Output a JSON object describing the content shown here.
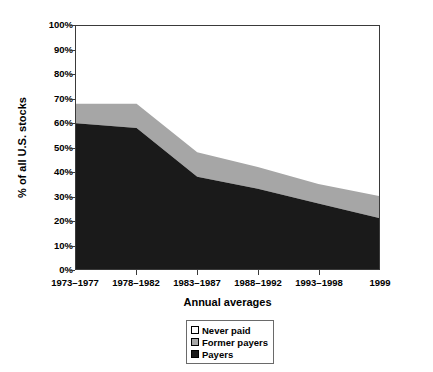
{
  "chart_data": {
    "type": "area",
    "stacked": true,
    "stack_total": 100,
    "title": "",
    "xlabel": "Annual averages",
    "ylabel": "% of all U.S. stocks",
    "categories": [
      "1973–1977",
      "1978–1982",
      "1983–1987",
      "1988–1992",
      "1993–1998",
      "1999"
    ],
    "ylim": [
      0,
      100
    ],
    "ytick_labels": [
      "0%",
      "10%",
      "20%",
      "30%",
      "40%",
      "50%",
      "60%",
      "70%",
      "80%",
      "90%",
      "100%"
    ],
    "ytick_values": [
      0,
      10,
      20,
      30,
      40,
      50,
      60,
      70,
      80,
      90,
      100
    ],
    "grid": false,
    "legend_position": "bottom-center",
    "series": [
      {
        "name": "Payers",
        "color": "#1a1a1a",
        "values": [
          60,
          58,
          38,
          33,
          27,
          21
        ]
      },
      {
        "name": "Former payers",
        "color": "#a6a6a6",
        "values": [
          8,
          10,
          10,
          9,
          8,
          9
        ]
      },
      {
        "name": "Never paid",
        "color": "#ffffff",
        "values": [
          32,
          32,
          52,
          58,
          65,
          70
        ]
      }
    ],
    "cumulative_tops": [
      {
        "series": "Payers",
        "values": [
          60,
          58,
          38,
          33,
          27,
          21
        ]
      },
      {
        "series": "Former payers",
        "values": [
          68,
          68,
          48,
          42,
          35,
          30
        ]
      },
      {
        "series": "Never paid",
        "values": [
          100,
          100,
          100,
          100,
          100,
          100
        ]
      }
    ]
  },
  "legend": {
    "items": [
      {
        "label": "Never paid",
        "swatch": "#ffffff"
      },
      {
        "label": "Former payers",
        "swatch": "#a6a6a6"
      },
      {
        "label": "Payers",
        "swatch": "#1a1a1a"
      }
    ]
  },
  "colors": {
    "payers": "#1a1a1a",
    "former_payers": "#a6a6a6",
    "never_paid": "#ffffff",
    "axis": "#3a3a3a",
    "background": "#ffffff"
  }
}
